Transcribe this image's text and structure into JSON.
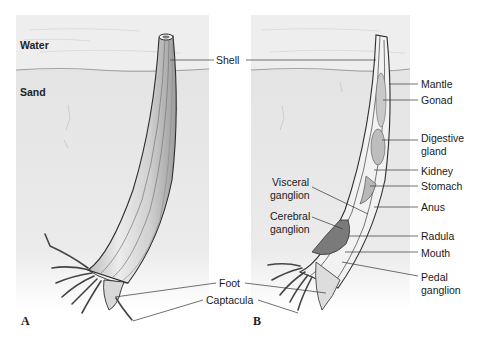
{
  "diagram": {
    "colors": {
      "background": "#ffffff",
      "water": "#ececec",
      "sand": "#e2e2e2",
      "shell_fill": "#d9d9d9",
      "outline": "#333333",
      "label_text": "#1a1a1a"
    },
    "panels": [
      {
        "id": "A",
        "letter": "A",
        "zone_labels": {
          "water": "Water",
          "sand": "Sand"
        },
        "view": "external"
      },
      {
        "id": "B",
        "letter": "B",
        "view": "internal cutaway"
      }
    ],
    "shared_labels": {
      "shell": "Shell",
      "foot": "Foot",
      "captacula": "Captacula"
    },
    "right_labels": {
      "mantle": "Mantle",
      "gonad": "Gonad",
      "digestive_gland_1": "Digestive",
      "digestive_gland_2": "gland",
      "kidney": "Kidney",
      "stomach": "Stomach",
      "anus": "Anus",
      "radula": "Radula",
      "mouth": "Mouth",
      "pedal_ganglion_1": "Pedal",
      "pedal_ganglion_2": "ganglion"
    },
    "left_labels": {
      "visceral_ganglion_1": "Visceral",
      "visceral_ganglion_2": "ganglion",
      "cerebral_ganglion_1": "Cerebral",
      "cerebral_ganglion_2": "ganglion"
    }
  }
}
